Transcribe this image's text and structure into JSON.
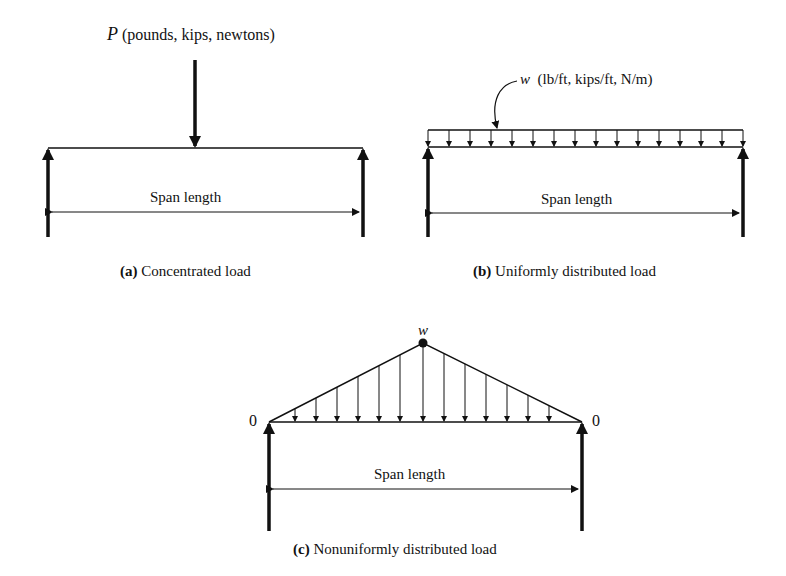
{
  "panels": [
    {
      "id": "a",
      "load_symbol": "P",
      "load_units": "(pounds, kips, newtons)",
      "span_label": "Span length",
      "caption_letter": "(a)",
      "caption_text": "Concentrated load"
    },
    {
      "id": "b",
      "load_symbol": "w",
      "load_units": "(lb/ft, kips/ft, N/m)",
      "span_label": "Span length",
      "caption_letter": "(b)",
      "caption_text": "Uniformly distributed load",
      "arrow_count": 16
    },
    {
      "id": "c",
      "load_symbol": "w",
      "left_end_value": "0",
      "right_end_value": "0",
      "span_label": "Span length",
      "caption_letter": "(c)",
      "caption_text": "Nonuniformly distributed load",
      "arrow_count": 13
    }
  ],
  "colors": {
    "ink": "#111111",
    "background": "#ffffff"
  }
}
